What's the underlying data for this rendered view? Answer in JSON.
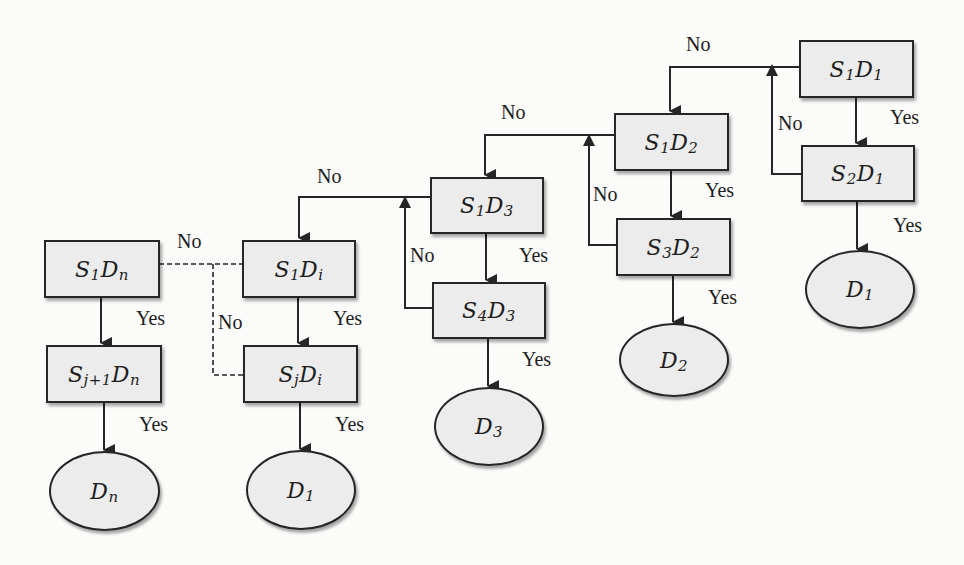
{
  "diagram": {
    "title": "",
    "type": "decision-flowchart",
    "nodes": [
      {
        "id": "S1Dn",
        "shape": "rect",
        "base1": "S",
        "sub1": "1",
        "base2": "D",
        "sub2": "n"
      },
      {
        "id": "Sj1Dn",
        "shape": "rect",
        "base1": "S",
        "sub1": "j+1",
        "base2": "D",
        "sub2": "n"
      },
      {
        "id": "Dn",
        "shape": "ellipse",
        "base1": "D",
        "sub1": "n"
      },
      {
        "id": "S1Di",
        "shape": "rect",
        "base1": "S",
        "sub1": "1",
        "base2": "D",
        "sub2": "i"
      },
      {
        "id": "SjDi",
        "shape": "rect",
        "base1": "S",
        "sub1": "j",
        "base2": "D",
        "sub2": "i"
      },
      {
        "id": "D1a",
        "shape": "ellipse",
        "base1": "D",
        "sub1": "1"
      },
      {
        "id": "S1D3",
        "shape": "rect",
        "base1": "S",
        "sub1": "1",
        "base2": "D",
        "sub2": "3"
      },
      {
        "id": "S4D3",
        "shape": "rect",
        "base1": "S",
        "sub1": "4",
        "base2": "D",
        "sub2": "3"
      },
      {
        "id": "D3",
        "shape": "ellipse",
        "base1": "D",
        "sub1": "3"
      },
      {
        "id": "S1D2",
        "shape": "rect",
        "base1": "S",
        "sub1": "1",
        "base2": "D",
        "sub2": "2"
      },
      {
        "id": "S3D2",
        "shape": "rect",
        "base1": "S",
        "sub1": "3",
        "base2": "D",
        "sub2": "2"
      },
      {
        "id": "D2",
        "shape": "ellipse",
        "base1": "D",
        "sub1": "2"
      },
      {
        "id": "S1D1",
        "shape": "rect",
        "base1": "S",
        "sub1": "1",
        "base2": "D",
        "sub2": "1"
      },
      {
        "id": "S2D1",
        "shape": "rect",
        "base1": "S",
        "sub1": "2",
        "base2": "D",
        "sub2": "1"
      },
      {
        "id": "D1b",
        "shape": "ellipse",
        "base1": "D",
        "sub1": "1"
      }
    ],
    "edges": [
      {
        "from": "S1D1",
        "to": "S2D1",
        "label": "Yes",
        "style": "solid"
      },
      {
        "from": "S2D1",
        "to": "D1b",
        "label": "Yes",
        "style": "solid"
      },
      {
        "from": "S2D1",
        "to": "S1D2",
        "label": "No",
        "style": "solid"
      },
      {
        "from": "S1D1",
        "to": "S1D2",
        "label": "No",
        "style": "solid"
      },
      {
        "from": "S1D2",
        "to": "S3D2",
        "label": "Yes",
        "style": "solid"
      },
      {
        "from": "S3D2",
        "to": "D2",
        "label": "Yes",
        "style": "solid"
      },
      {
        "from": "S3D2",
        "to": "S1D3",
        "label": "No",
        "style": "solid"
      },
      {
        "from": "S1D2",
        "to": "S1D3",
        "label": "No",
        "style": "solid"
      },
      {
        "from": "S1D3",
        "to": "S4D3",
        "label": "Yes",
        "style": "solid"
      },
      {
        "from": "S4D3",
        "to": "D3",
        "label": "Yes",
        "style": "solid"
      },
      {
        "from": "S4D3",
        "to": "S1Di",
        "label": "No",
        "style": "solid"
      },
      {
        "from": "S1D3",
        "to": "S1Di",
        "label": "No",
        "style": "solid"
      },
      {
        "from": "S1Di",
        "to": "SjDi",
        "label": "Yes",
        "style": "solid"
      },
      {
        "from": "SjDi",
        "to": "D1a",
        "label": "Yes",
        "style": "solid"
      },
      {
        "from": "SjDi",
        "to": "S1Dn",
        "label": "No",
        "style": "dashed"
      },
      {
        "from": "S1Di",
        "to": "S1Dn",
        "label": "No",
        "style": "dashed"
      },
      {
        "from": "S1Dn",
        "to": "Sj1Dn",
        "label": "Yes",
        "style": "solid"
      },
      {
        "from": "Sj1Dn",
        "to": "Dn",
        "label": "Yes",
        "style": "solid"
      }
    ],
    "labels": {
      "yes": "Yes",
      "no": "No"
    },
    "colors": {
      "node_fill": "#ececec",
      "stroke": "#262626",
      "background": "#fbfbfa"
    }
  }
}
